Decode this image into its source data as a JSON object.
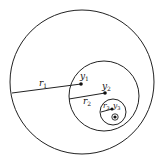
{
  "diagram": {
    "type": "nested-circles",
    "stroke_color": "#222222",
    "circles": [
      {
        "name": "outer",
        "cx": 82,
        "cy": 82,
        "r": 72,
        "radius_label": "r",
        "radius_sub": "1",
        "center_label": "y",
        "center_sub": "1"
      },
      {
        "name": "middle",
        "cx": 104,
        "cy": 96,
        "r": 35,
        "radius_label": "r",
        "radius_sub": "2",
        "center_label": "y",
        "center_sub": "2"
      },
      {
        "name": "inner",
        "cx": 113,
        "cy": 112,
        "r": 13,
        "radius_label": "r",
        "radius_sub": "3",
        "center_label": "y",
        "center_sub": "3"
      }
    ],
    "labels": {
      "r1": "r",
      "r1_sub": "1",
      "r2": "r",
      "r2_sub": "2",
      "r3": "r",
      "r3_sub": "3",
      "y1": "y",
      "y1_sub": "1",
      "y2": "y",
      "y2_sub": "2",
      "y3": "y",
      "y3_sub": "3"
    }
  }
}
